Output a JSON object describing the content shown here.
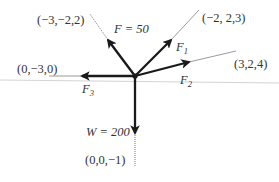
{
  "diagram": {
    "type": "force-diagram",
    "colors": {
      "arrow": "#1a1a1a",
      "guide_line": "#555555",
      "baseline": "#c8c8c8",
      "text": "#333333"
    },
    "origin": {
      "x": 135,
      "y": 76
    },
    "forces": [
      {
        "id": "F",
        "label": "F",
        "subscript": "",
        "value_text": "F = 50",
        "direction_label": "(−3,−2,2)"
      },
      {
        "id": "F1",
        "label": "F",
        "subscript": "1",
        "direction_label": "(−2, 2,3)"
      },
      {
        "id": "F2",
        "label": "F",
        "subscript": "2",
        "direction_label": "(3,2,4)"
      },
      {
        "id": "F3",
        "label": "F",
        "subscript": "3",
        "direction_label": "(0,−3,0)"
      },
      {
        "id": "W",
        "label": "W",
        "value_text": "W = 200",
        "direction_label": "(0,0,−1)"
      }
    ],
    "labels": {
      "f_value": "F = 50",
      "f_dir": "(−3,−2,2)",
      "f1_main": "F",
      "f1_sub": "1",
      "f1_dir": "(−2, 2,3)",
      "f2_main": "F",
      "f2_sub": "2",
      "f2_dir": "(3,2,4)",
      "f3_main": "F",
      "f3_sub": "3",
      "f3_dir": "(0,−3,0)",
      "w_value": "W = 200",
      "w_dir": "(0,0,−1)"
    }
  }
}
